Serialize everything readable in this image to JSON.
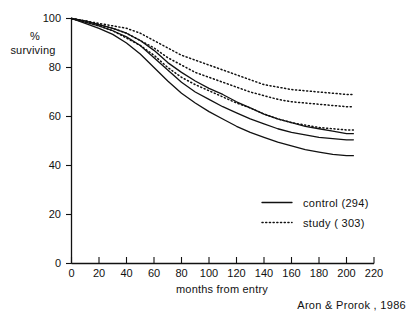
{
  "chart_data": {
    "type": "line",
    "title": "",
    "xlabel": "months from entry",
    "ylabel": "% surviving",
    "xlim": [
      0,
      220
    ],
    "ylim": [
      0,
      100
    ],
    "xticks": [
      0,
      20,
      40,
      60,
      80,
      100,
      120,
      140,
      160,
      180,
      200,
      220
    ],
    "yticks": [
      0,
      20,
      40,
      60,
      80,
      100
    ],
    "grid": false,
    "legend_position": "inside-lower-right",
    "annotation": "Aron & Prorok , 1986",
    "x": [
      0,
      10,
      20,
      30,
      40,
      50,
      60,
      70,
      80,
      90,
      100,
      110,
      120,
      130,
      140,
      150,
      160,
      170,
      180,
      190,
      200,
      205
    ],
    "series": [
      {
        "name": "study (303)",
        "group": "study",
        "style": "dotted",
        "label": "study  ( 303)",
        "values": [
          100,
          99,
          98,
          97,
          96,
          94,
          91,
          88,
          85,
          83,
          81,
          79,
          77,
          75,
          73,
          72,
          71,
          70.5,
          70,
          69.5,
          69,
          69
        ]
      },
      {
        "name": "study (303) mid",
        "group": "study",
        "style": "dotted",
        "label": "",
        "values": [
          100,
          99,
          97.5,
          96,
          94,
          91,
          88,
          84,
          81,
          78,
          76,
          74,
          72,
          70,
          68.5,
          67,
          66,
          65.5,
          65,
          64.5,
          64,
          64
        ]
      },
      {
        "name": "study (303) lower",
        "group": "study",
        "style": "dotted",
        "label": "",
        "values": [
          100,
          98.5,
          97,
          95,
          92,
          89,
          85,
          80,
          76,
          73,
          70.5,
          68,
          65.5,
          63.5,
          61,
          59,
          57.5,
          56.5,
          55.5,
          55,
          54.5,
          54.5
        ]
      },
      {
        "name": "control (294) upper",
        "group": "control",
        "style": "solid",
        "label": "",
        "values": [
          100,
          99,
          97.5,
          96,
          94,
          91,
          87,
          82,
          78,
          74.5,
          71.5,
          69,
          66,
          63.5,
          61,
          59,
          57.5,
          56,
          55,
          54,
          53,
          53
        ]
      },
      {
        "name": "control (294)",
        "group": "control",
        "style": "solid",
        "label": "control (294)",
        "values": [
          100,
          98.5,
          97,
          95,
          92.5,
          89,
          84,
          79,
          74,
          70,
          67,
          64,
          61.5,
          59,
          57,
          55,
          53.5,
          52.5,
          51.5,
          51,
          50.5,
          50.5
        ]
      },
      {
        "name": "control (294) lower",
        "group": "control",
        "style": "solid",
        "label": "",
        "values": [
          100,
          98,
          96,
          93.5,
          90,
          85.5,
          80,
          74.5,
          69.5,
          65.5,
          62,
          59,
          56,
          53.5,
          51.5,
          49.5,
          48,
          46.5,
          45.5,
          44.5,
          44,
          44
        ]
      }
    ],
    "legend": [
      {
        "label": "control (294)",
        "style": "solid"
      },
      {
        "label": "study  ( 303)",
        "style": "dotted"
      }
    ]
  },
  "axis": {
    "y_label_line1": "%",
    "y_label_line2": "surviving",
    "x_label": "months from entry",
    "credit": "Aron & Prorok , 1986",
    "y_tick_labels": [
      "0",
      "20",
      "40",
      "60",
      "80",
      "100"
    ],
    "x_tick_labels": [
      "0",
      "20",
      "40",
      "60",
      "80",
      "100",
      "120",
      "140",
      "160",
      "180",
      "200",
      "220"
    ]
  },
  "legend": {
    "control_label": "control (294)",
    "study_label": "study  ( 303)"
  }
}
